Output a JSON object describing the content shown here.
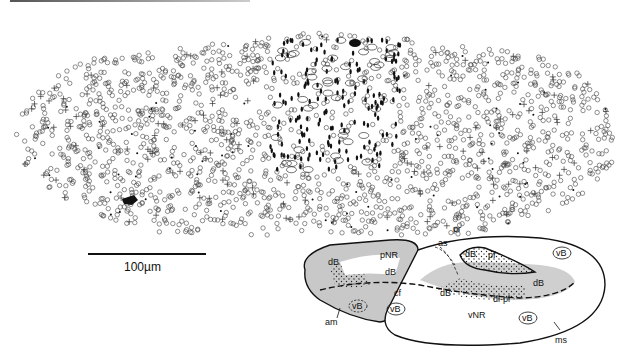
{
  "figure": {
    "type": "cell distribution map with schematic inset",
    "scale_bar": {
      "label": "100µm"
    },
    "map": {
      "symbols": [
        "open-circle",
        "cross",
        "filled-dot",
        "dash",
        "open-ellipse",
        "filled-blob"
      ],
      "arrow_marker": "filled-arrowhead"
    },
    "inset": {
      "labels": {
        "pr": "pr",
        "as": "as",
        "pf": "pf",
        "pNR": "pNR",
        "dB1": "dB",
        "dB2": "dB",
        "dB3": "dB",
        "dB4": "dB",
        "dB5": "dB",
        "vB1": "vB",
        "vB2": "vB",
        "vB3": "vB",
        "vB4": "vB",
        "cf": "cf",
        "am": "am",
        "vNR": "vNR",
        "dlpl": "dl-pl",
        "ms": "ms"
      }
    }
  }
}
